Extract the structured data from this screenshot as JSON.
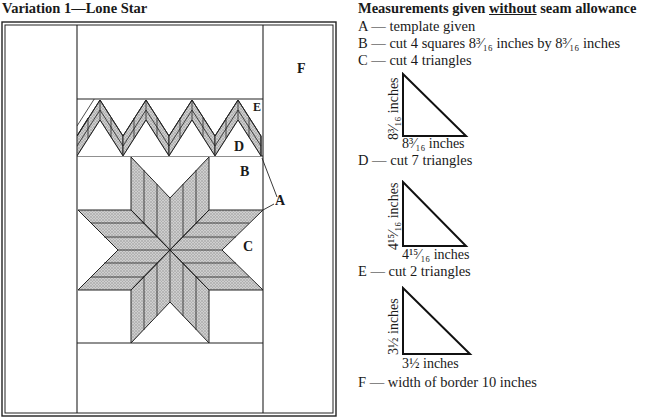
{
  "title": "Variation 1—Lone Star",
  "diagram": {
    "labels": {
      "A": "A",
      "B": "B",
      "C": "C",
      "D": "D",
      "E": "E",
      "F": "F"
    }
  },
  "legend": {
    "heading_pre": "Measurements given ",
    "heading_emph": "without",
    "heading_post": " seam allowance",
    "items": [
      {
        "key": "A —",
        "text": "template given"
      },
      {
        "key": "B —",
        "text": "cut 4 squares 8³⁄₁₆ inches by 8³⁄₁₆ inches"
      },
      {
        "key": "C —",
        "text": "cut 4 triangles"
      },
      {
        "key": "D —",
        "text": "cut 7 triangles"
      },
      {
        "key": "E —",
        "text": "cut 2 triangles"
      },
      {
        "key": "F —",
        "text": "width of border 10 inches"
      }
    ],
    "triangles": [
      {
        "for": "C",
        "side_label": "8³⁄₁₆ inches",
        "base_label": "8³⁄₁₆ inches"
      },
      {
        "for": "D",
        "side_label": "4¹⁵⁄₁₆ inches",
        "base_label": "4¹⁵⁄₁₆ inches"
      },
      {
        "for": "E",
        "side_label": "3½ inches",
        "base_label": "3½ inches"
      }
    ]
  }
}
